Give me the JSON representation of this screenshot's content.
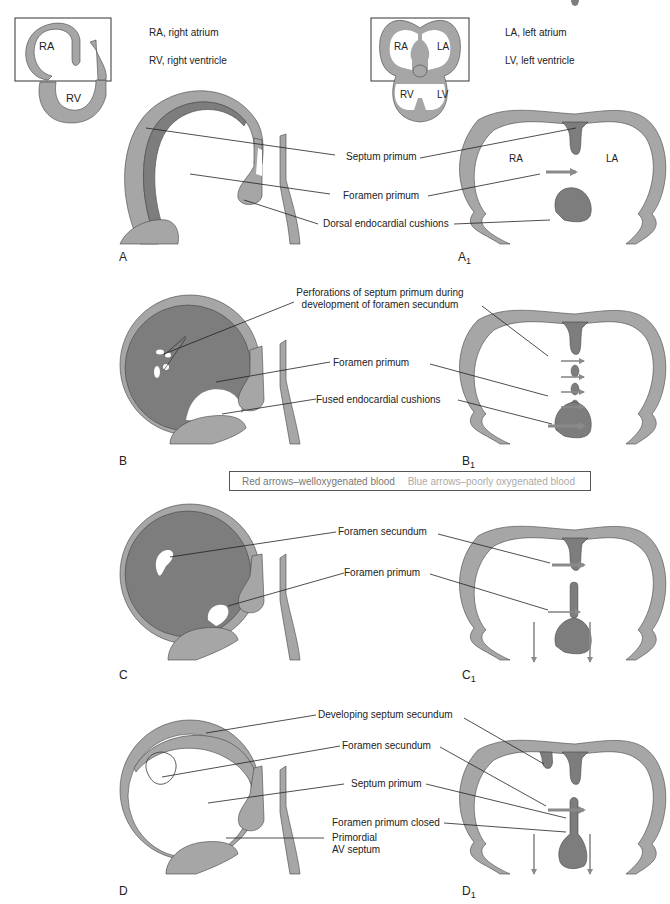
{
  "key": {
    "ra": "RA, right atrium",
    "rv": "RV, right ventricle",
    "la": "LA, left atrium",
    "lv": "LV, left ventricle"
  },
  "inset_left": {
    "ra": "RA",
    "rv": "RV"
  },
  "inset_right": {
    "ra": "RA",
    "la": "LA",
    "rv": "RV",
    "lv": "LV"
  },
  "panels": {
    "a": "A",
    "a1": "A",
    "a1_sub": "1",
    "b": "B",
    "b1": "B",
    "b1_sub": "1",
    "c": "C",
    "c1": "C",
    "c1_sub": "1",
    "d": "D",
    "d1": "D",
    "d1_sub": "1"
  },
  "row_a": {
    "septum_primum": "Septum primum",
    "foramen_primum": "Foramen primum",
    "dorsal_cushions": "Dorsal endocardial cushions",
    "ra": "RA",
    "la": "LA"
  },
  "row_b": {
    "perforations_1": "Perforations of septum primum during",
    "perforations_2": "development of foramen secundum",
    "foramen_primum": "Foramen primum",
    "fused_cushions": "Fused endocardial cushions"
  },
  "legend": {
    "red": "Red arrows–welloxygenated blood",
    "blue": "Blue arrows–poorly oxygenated blood"
  },
  "row_c": {
    "foramen_secundum": "Foramen secundum",
    "foramen_primum": "Foramen primum"
  },
  "row_d": {
    "septum_secundum": "Developing septum secundum",
    "foramen_secundum": "Foramen secundum",
    "septum_primum": "Septum primum",
    "foramen_primum_closed": "Foramen primum closed",
    "av_septum_1": "Primordial",
    "av_septum_2": "AV septum"
  },
  "colors": {
    "wall": "#a6a6a6",
    "dark": "#7d7d7d",
    "outline": "#444444",
    "arrow": "#8a8a8a"
  }
}
